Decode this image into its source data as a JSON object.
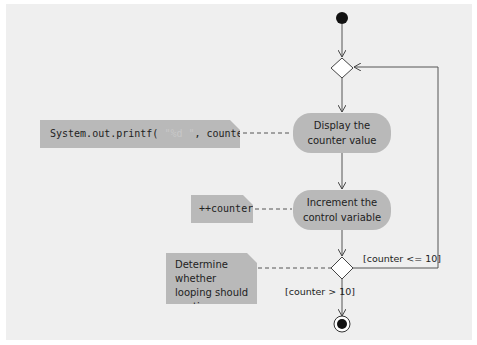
{
  "diagram": {
    "type": "UML activity diagram",
    "actions": [
      {
        "label_line1": "Display the",
        "label_line2": "counter value"
      },
      {
        "label_line1": "Increment the",
        "label_line2": "control variable"
      }
    ],
    "notes": {
      "printf": {
        "prefix": "System.out.printf(",
        "format": " \"%d  \"",
        "suffix": ", counter );"
      },
      "increment": {
        "text": "++counter"
      },
      "decision": {
        "line1": "Determine whether",
        "line2": "looping should",
        "line3": "continue"
      }
    },
    "guards": {
      "loop": "[counter <= 10]",
      "exit": "[counter > 10]"
    },
    "colors": {
      "background": "#efefef",
      "shape_fill": "#b9b9b9",
      "line": "#555555"
    }
  }
}
